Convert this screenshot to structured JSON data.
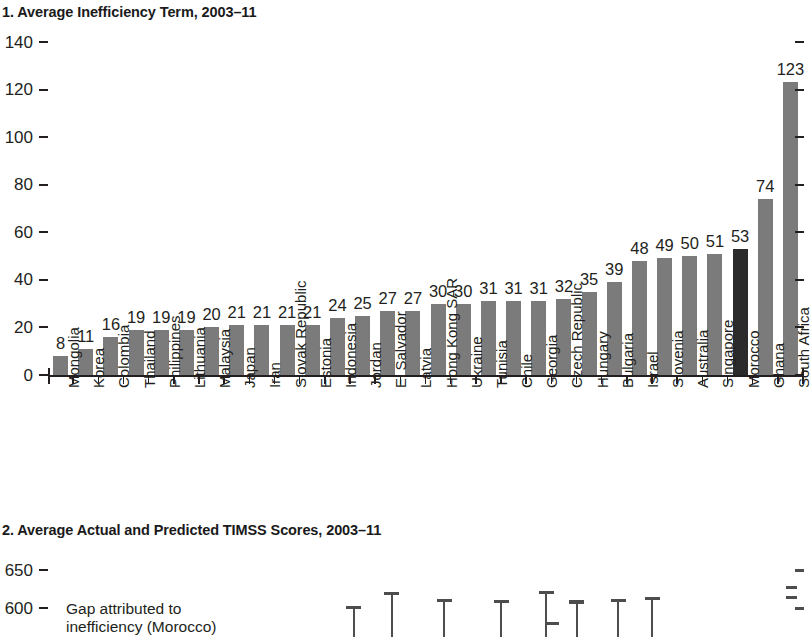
{
  "figure": {
    "panel1_title": "1. Average Inefficiency Term, 2003–11",
    "panel2_title": "2. Average Actual and Predicted TIMSS Scores, 2003–11",
    "annotation": "Gap attributed to\ninefficiency (Morocco)",
    "bar_color": "#7b7b7b",
    "highlight_color": "#2b2b2b",
    "axis_color": "#231f20"
  },
  "chart_data": [
    {
      "type": "bar",
      "title": "1. Average Inefficiency Term, 2003–11",
      "xlabel": "",
      "ylabel": "",
      "ylim": [
        0,
        140
      ],
      "yticks": [
        0,
        20,
        40,
        60,
        80,
        100,
        120,
        140
      ],
      "ytick_labels": [
        "0",
        "20",
        "40",
        "60",
        "80",
        "100",
        "120",
        "140"
      ],
      "grid": false,
      "legend": "none",
      "data_labels": true,
      "highlight_category": "Morocco",
      "categories": [
        "Mongolia",
        "Korea",
        "Colombia",
        "Thailand",
        "Philippines",
        "Lithuania",
        "Malaysia",
        "Japan",
        "Iran",
        "Slovak Republic",
        "Estonia",
        "Indonesia",
        "Jordan",
        "El Salvador",
        "Latvia",
        "Hong Kong SAR",
        "Ukraine",
        "Tunisia",
        "Chile",
        "Georgia",
        "Czech Republic",
        "Hungary",
        "Bulgaria",
        "Israel",
        "Slovenia",
        "Australia",
        "Singapore",
        "Morocco",
        "Ghana",
        "South Africa"
      ],
      "values": [
        8,
        11,
        16,
        19,
        19,
        19,
        20,
        21,
        21,
        21,
        21,
        24,
        25,
        27,
        27,
        30,
        30,
        31,
        31,
        31,
        32,
        35,
        39,
        48,
        49,
        50,
        51,
        53,
        74,
        123
      ]
    },
    {
      "type": "bar",
      "title": "2. Average Actual and Predicted TIMSS Scores, 2003–11",
      "xlabel": "",
      "ylabel": "",
      "ylim": [
        550,
        660
      ],
      "yticks": [
        600,
        650
      ],
      "ytick_labels": [
        "600",
        "650"
      ],
      "grid": false,
      "legend": "none",
      "note": "Panel partially visible (cropped at bottom of screenshot); markers show predicted-score caps with stems.",
      "annotations": [
        "Gap attributed to inefficiency (Morocco)"
      ],
      "markers": [
        {
          "x_frac": 0.405,
          "top_value": 597
        },
        {
          "x_frac": 0.455,
          "top_value": 579
        },
        {
          "x_frac": 0.525,
          "top_value": 588
        },
        {
          "x_frac": 0.6,
          "top_value": 589
        },
        {
          "x_frac": 0.66,
          "top_value": 577
        },
        {
          "x_frac": 0.7,
          "top_value": 590
        },
        {
          "x_frac": 0.755,
          "top_value": 588
        },
        {
          "x_frac": 0.8,
          "top_value": 585
        }
      ]
    }
  ],
  "panel1": {
    "yticks": [
      "140",
      "120",
      "100",
      "80",
      "60",
      "40",
      "20",
      "0"
    ]
  },
  "panel2": {
    "yticks": [
      "650",
      "600"
    ]
  }
}
